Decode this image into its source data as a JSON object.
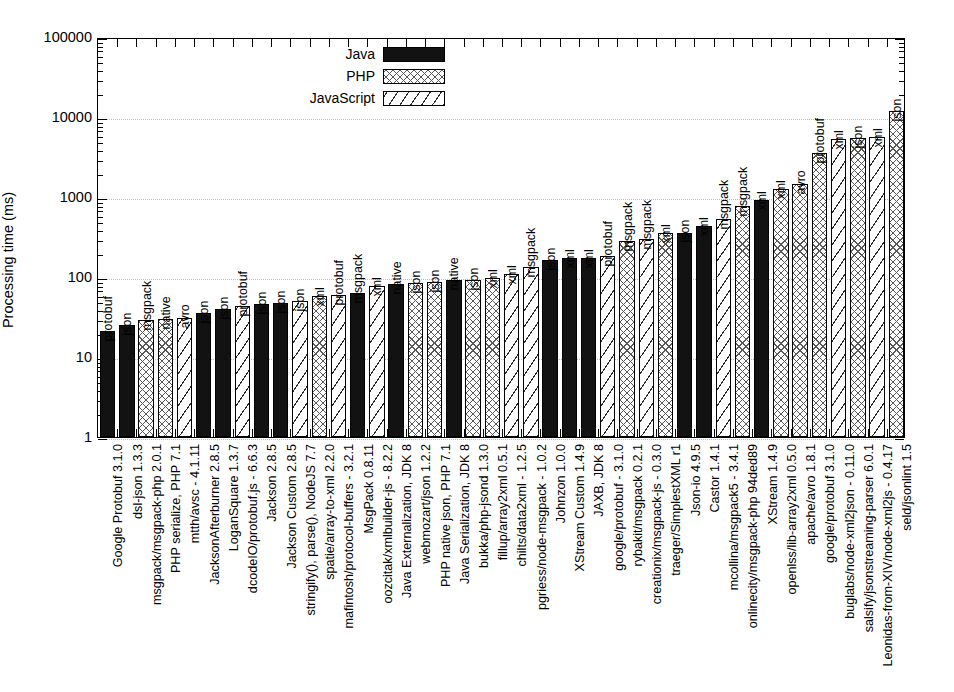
{
  "chart": {
    "type": "bar",
    "ylabel": "Processing time (ms)",
    "xlabel": "",
    "title": "",
    "grid": true,
    "legend_position": "top-left-inside",
    "yscale": "log",
    "ylim": [
      1,
      100000
    ],
    "ytick_labels": [
      "100000",
      "10000",
      "1000",
      "100",
      "10",
      "1"
    ],
    "legend": [
      {
        "label": "Java",
        "pattern": "solid-black",
        "key": "java"
      },
      {
        "label": "PHP",
        "pattern": "cross-hatch",
        "key": "php"
      },
      {
        "label": "JavaScript",
        "pattern": "diagonal-stripe",
        "key": "javascript"
      }
    ]
  },
  "chart_data": {
    "type": "bar",
    "title": "",
    "xlabel": "",
    "ylabel": "Processing time (ms)",
    "yscale": "log",
    "ylim": [
      1,
      100000
    ],
    "ytick_labels": [
      "100000",
      "10000",
      "1000",
      "100",
      "10",
      "1"
    ],
    "grid": true,
    "legend_position": "top-left-inside",
    "series_names": [
      "Java",
      "PHP",
      "JavaScript"
    ],
    "categories": [
      "Google Protobuf 3.1.0",
      "dsl-json 1.3.3",
      "msgpack/msgpack-php 2.0.1",
      "PHP serialize, PHP 7.1",
      "mtth/avsc - 4.1.11",
      "JacksonAfterburner 2.8.5",
      "LoganSquare 1.3.7",
      "dcodeIO/protobuf.js - 6.6.3",
      "Jackson 2.8.5",
      "Jackson Custom 2.8.5",
      "stringify(), parse(), NodeJS 7.7",
      "spatie/array-to-xml 2.2.0",
      "mafintosh/protocol-buffers - 3.2.1",
      "MsgPack 0.8.11",
      "oozcitak/xmlbuilder-js - 8.2.2",
      "Java Externalization, JDK 8",
      "webmozart/json 1.2.2",
      "PHP native json, PHP 7.1",
      "Java Serialization, JDK 8",
      "bukka/php-jsond 1.3.0",
      "fillup/array2xml 0.5.1",
      "chilts/data2xml - 1.2.5",
      "pgriess/node-msgpack - 1.0.2",
      "Johnzon 1.0.0",
      "XStream Custom 1.4.9",
      "JAXB, JDK 8",
      "google/protobuf - 3.1.0",
      "rybakit/msgpack 0.2.1",
      "creationix/msgpack-js - 0.3.0",
      "traeger/SimplestXML r1",
      "Json-io 4.9.5",
      "Castor 1.4.1",
      "mcollina/msgpack5 - 3.4.1",
      "onlinecity/msgpack-php 94ded89",
      "XStream 1.4.9",
      "openlss/lib-array2xml 0.5.0",
      "apache/avro 1.8.1",
      "google/protobuf 3.1.0",
      "buglabs/node-xml2json - 0.11.0",
      "salsify/jsonstreaming-parser 6.0.1",
      "Leonidas-from-XIV/node-xml2js - 0.4.17",
      "seld/jsonlint 1.5"
    ],
    "bars": [
      {
        "category": "Google Protobuf 3.1.0",
        "series": "Java",
        "format": "protobuf",
        "value": 21
      },
      {
        "category": "dsl-json 1.3.3",
        "series": "Java",
        "format": "json",
        "value": 25
      },
      {
        "category": "msgpack/msgpack-php 2.0.1",
        "series": "PHP",
        "format": "msgpack",
        "value": 29
      },
      {
        "category": "PHP serialize, PHP 7.1",
        "series": "PHP",
        "format": "native",
        "value": 30
      },
      {
        "category": "mtth/avsc - 4.1.11",
        "series": "JavaScript",
        "format": "avro",
        "value": 31
      },
      {
        "category": "JacksonAfterburner 2.8.5",
        "series": "Java",
        "format": "json",
        "value": 35
      },
      {
        "category": "LoganSquare 1.3.7",
        "series": "Java",
        "format": "json",
        "value": 40
      },
      {
        "category": "dcodeIO/protobuf.js - 6.6.3",
        "series": "JavaScript",
        "format": "protobuf",
        "value": 43
      },
      {
        "category": "Jackson 2.8.5",
        "series": "Java",
        "format": "json",
        "value": 46
      },
      {
        "category": "Jackson Custom 2.8.5",
        "series": "Java",
        "format": "json",
        "value": 48
      },
      {
        "category": "stringify(), parse(), NodeJS 7.7",
        "series": "JavaScript",
        "format": "json",
        "value": 50
      },
      {
        "category": "spatie/array-to-xml 2.2.0",
        "series": "PHP",
        "format": "xml",
        "value": 58
      },
      {
        "category": "mafintosh/protocol-buffers - 3.2.1",
        "series": "JavaScript",
        "format": "protobuf",
        "value": 60
      },
      {
        "category": "MsgPack 0.8.11",
        "series": "Java",
        "format": "msgpack",
        "value": 63
      },
      {
        "category": "oozcitak/xmlbuilder-js - 8.2.2",
        "series": "JavaScript",
        "format": "xml",
        "value": 78
      },
      {
        "category": "Java Externalization, JDK 8",
        "series": "Java",
        "format": "native",
        "value": 82
      },
      {
        "category": "webmozart/json 1.2.2",
        "series": "PHP",
        "format": "json",
        "value": 84
      },
      {
        "category": "PHP native json, PHP 7.1",
        "series": "PHP",
        "format": "json",
        "value": 86
      },
      {
        "category": "Java Serialization, JDK 8",
        "series": "Java",
        "format": "native",
        "value": 92
      },
      {
        "category": "bukka/php-jsond 1.3.0",
        "series": "PHP",
        "format": "json",
        "value": 92
      },
      {
        "category": "fillup/array2xml 0.5.1",
        "series": "PHP",
        "format": "xml",
        "value": 96
      },
      {
        "category": "chilts/data2xml - 1.2.5",
        "series": "JavaScript",
        "format": "xml",
        "value": 110
      },
      {
        "category": "pgriess/node-msgpack - 1.0.2",
        "series": "JavaScript",
        "format": "msgpack",
        "value": 135
      },
      {
        "category": "Johnzon 1.0.0",
        "series": "Java",
        "format": "json",
        "value": 165
      },
      {
        "category": "XStream Custom 1.4.9",
        "series": "Java",
        "format": "xml",
        "value": 172
      },
      {
        "category": "JAXB, JDK 8",
        "series": "Java",
        "format": "xml",
        "value": 175
      },
      {
        "category": "google/protobuf - 3.1.0",
        "series": "JavaScript",
        "format": "protobuf",
        "value": 185
      },
      {
        "category": "rybakit/msgpack 0.2.1",
        "series": "PHP",
        "format": "msgpack",
        "value": 285
      },
      {
        "category": "creationix/msgpack-js - 0.3.0",
        "series": "JavaScript",
        "format": "msgpack",
        "value": 300
      },
      {
        "category": "traeger/SimplestXML r1",
        "series": "PHP",
        "format": "xml",
        "value": 355
      },
      {
        "category": "Json-io 4.9.5",
        "series": "Java",
        "format": "json",
        "value": 360
      },
      {
        "category": "Castor 1.4.1",
        "series": "Java",
        "format": "xml",
        "value": 440
      },
      {
        "category": "mcollina/msgpack5 - 3.4.1",
        "series": "JavaScript",
        "format": "msgpack",
        "value": 530
      },
      {
        "category": "onlinecity/msgpack-php 94ded89",
        "series": "PHP",
        "format": "msgpack",
        "value": 770
      },
      {
        "category": "XStream 1.4.9",
        "series": "Java",
        "format": "xml",
        "value": 930
      },
      {
        "category": "openlss/lib-array2xml 0.5.0",
        "series": "PHP",
        "format": "xml",
        "value": 1250
      },
      {
        "category": "apache/avro 1.8.1",
        "series": "PHP",
        "format": "avro",
        "value": 1450
      },
      {
        "category": "google/protobuf 3.1.0",
        "series": "PHP",
        "format": "protobuf",
        "value": 3500
      },
      {
        "category": "buglabs/node-xml2json - 0.11.0",
        "series": "JavaScript",
        "format": "xml",
        "value": 5300
      },
      {
        "category": "salsify/jsonstreaming-parser 6.0.1",
        "series": "PHP",
        "format": "json",
        "value": 5400
      },
      {
        "category": "Leonidas-from-XIV/node-xml2js - 0.4.17",
        "series": "JavaScript",
        "format": "xml",
        "value": 5700
      },
      {
        "category": "seld/jsonlint 1.5",
        "series": "PHP",
        "format": "json",
        "value": 12000
      }
    ]
  }
}
